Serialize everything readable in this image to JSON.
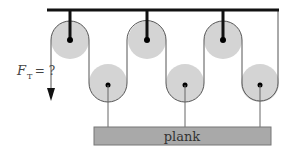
{
  "diagram": {
    "type": "pulley-system",
    "force_label": {
      "symbol": "F",
      "subscript": "T",
      "suffix": " = ?"
    },
    "plank_label": "plank",
    "colors": {
      "ceiling": "#111111",
      "pulley_fill": "#d4d4d4",
      "rope": "#555555",
      "axle": "#000000",
      "plank_fill": "#a9a9a9",
      "plank_stroke": "#666666",
      "text": "#333333"
    },
    "top_pulleys": [
      {
        "cx": 70,
        "cy": 40,
        "r": 19
      },
      {
        "cx": 147,
        "cy": 40,
        "r": 19
      },
      {
        "cx": 223,
        "cy": 40,
        "r": 19
      }
    ],
    "bottom_pulleys": [
      {
        "cx": 108,
        "cy": 83,
        "r": 19
      },
      {
        "cx": 185,
        "cy": 83,
        "r": 19
      },
      {
        "cx": 260,
        "cy": 83,
        "r": 19
      }
    ]
  }
}
